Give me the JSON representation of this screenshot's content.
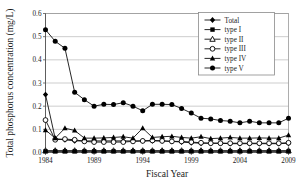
{
  "chart_data": {
    "type": "line",
    "title": "",
    "xlabel": "Fiscal Year",
    "ylabel": "Total phosphorus concentration (mg/L)",
    "xlim": [
      1984,
      2009
    ],
    "ylim": [
      0.0,
      0.6
    ],
    "grid": true,
    "legend_position": "top-right",
    "x_tick_labels": [
      "1984",
      "1989",
      "1994",
      "1999",
      "2004",
      "2009"
    ],
    "x_ticks": [
      1984,
      1989,
      1994,
      1999,
      2004,
      2009
    ],
    "y_tick_labels": [
      "0.0",
      "0.1",
      "0.2",
      "0.3",
      "0.4",
      "0.5",
      "0.6"
    ],
    "y_ticks": [
      0.0,
      0.1,
      0.2,
      0.3,
      0.4,
      0.5,
      0.6
    ],
    "x": [
      1984,
      1985,
      1986,
      1987,
      1988,
      1989,
      1990,
      1991,
      1992,
      1993,
      1994,
      1995,
      1996,
      1997,
      1998,
      1999,
      2000,
      2001,
      2002,
      2003,
      2004,
      2005,
      2006,
      2007,
      2008,
      2009
    ],
    "series": [
      {
        "name": "Total",
        "marker": "diamond-filled",
        "values": [
          0.25,
          0.06,
          0.055,
          0.05,
          0.05,
          0.05,
          0.05,
          0.05,
          0.05,
          0.05,
          0.05,
          0.05,
          0.05,
          0.048,
          0.045,
          0.042,
          0.04,
          0.04,
          0.04,
          0.038,
          0.038,
          0.038,
          0.038,
          0.038,
          0.038,
          0.04
        ]
      },
      {
        "name": "type I",
        "marker": "square-filled",
        "values": [
          0.005,
          0.005,
          0.005,
          0.005,
          0.005,
          0.005,
          0.005,
          0.005,
          0.005,
          0.005,
          0.005,
          0.005,
          0.005,
          0.005,
          0.005,
          0.005,
          0.005,
          0.005,
          0.005,
          0.005,
          0.005,
          0.005,
          0.005,
          0.005,
          0.005,
          0.005
        ]
      },
      {
        "name": "type II",
        "marker": "triangle-open",
        "values": [
          0.008,
          0.008,
          0.008,
          0.008,
          0.008,
          0.008,
          0.008,
          0.008,
          0.008,
          0.008,
          0.008,
          0.008,
          0.008,
          0.008,
          0.008,
          0.008,
          0.008,
          0.008,
          0.008,
          0.008,
          0.008,
          0.008,
          0.008,
          0.008,
          0.008,
          0.008
        ]
      },
      {
        "name": "type III",
        "marker": "circle-open",
        "values": [
          0.14,
          0.055,
          0.058,
          0.055,
          0.048,
          0.045,
          0.045,
          0.045,
          0.045,
          0.048,
          0.05,
          0.052,
          0.05,
          0.048,
          0.048,
          0.045,
          0.042,
          0.04,
          0.04,
          0.04,
          0.04,
          0.04,
          0.04,
          0.04,
          0.04,
          0.042
        ]
      },
      {
        "name": "type IV",
        "marker": "triangle-filled",
        "values": [
          0.097,
          0.062,
          0.105,
          0.095,
          0.062,
          0.062,
          0.063,
          0.065,
          0.068,
          0.062,
          0.105,
          0.065,
          0.068,
          0.07,
          0.065,
          0.062,
          0.068,
          0.06,
          0.062,
          0.065,
          0.062,
          0.062,
          0.063,
          0.062,
          0.062,
          0.075
        ]
      },
      {
        "name": "type V",
        "marker": "circle-filled",
        "values": [
          0.53,
          0.48,
          0.45,
          0.26,
          0.228,
          0.2,
          0.208,
          0.207,
          0.215,
          0.2,
          0.18,
          0.208,
          0.208,
          0.207,
          0.19,
          0.17,
          0.148,
          0.145,
          0.138,
          0.135,
          0.128,
          0.135,
          0.128,
          0.128,
          0.128,
          0.148
        ]
      }
    ]
  }
}
